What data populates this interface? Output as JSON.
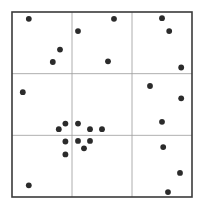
{
  "chart_data": {
    "type": "scatter",
    "title": "",
    "xlabel": "",
    "ylabel": "",
    "xlim": [
      0,
      3
    ],
    "ylim": [
      0,
      3
    ],
    "grid": {
      "rows": 3,
      "cols": 3,
      "on": true
    },
    "legend": "none",
    "colors": {
      "point": "#2b2b2b",
      "frame": "#3a3a3a",
      "grid": "#9a9a9a",
      "background": "#ffffff"
    },
    "series": [
      {
        "name": "points",
        "points": [
          {
            "x": 0.28,
            "y": 2.89
          },
          {
            "x": 1.1,
            "y": 2.69
          },
          {
            "x": 1.7,
            "y": 2.89
          },
          {
            "x": 2.5,
            "y": 2.9
          },
          {
            "x": 2.62,
            "y": 2.69
          },
          {
            "x": 0.8,
            "y": 2.39
          },
          {
            "x": 0.68,
            "y": 2.19
          },
          {
            "x": 1.6,
            "y": 2.2
          },
          {
            "x": 2.82,
            "y": 2.1
          },
          {
            "x": 0.18,
            "y": 1.7
          },
          {
            "x": 2.3,
            "y": 1.8
          },
          {
            "x": 2.82,
            "y": 1.6
          },
          {
            "x": 2.5,
            "y": 1.22
          },
          {
            "x": 0.78,
            "y": 1.1
          },
          {
            "x": 0.89,
            "y": 1.19
          },
          {
            "x": 1.1,
            "y": 1.19
          },
          {
            "x": 1.3,
            "y": 1.1
          },
          {
            "x": 1.5,
            "y": 1.1
          },
          {
            "x": 0.89,
            "y": 0.9
          },
          {
            "x": 1.1,
            "y": 0.91
          },
          {
            "x": 1.3,
            "y": 0.91
          },
          {
            "x": 1.2,
            "y": 0.79
          },
          {
            "x": 0.89,
            "y": 0.69
          },
          {
            "x": 2.52,
            "y": 0.81
          },
          {
            "x": 2.8,
            "y": 0.39
          },
          {
            "x": 0.28,
            "y": 0.19
          },
          {
            "x": 2.6,
            "y": 0.08
          }
        ]
      }
    ]
  }
}
